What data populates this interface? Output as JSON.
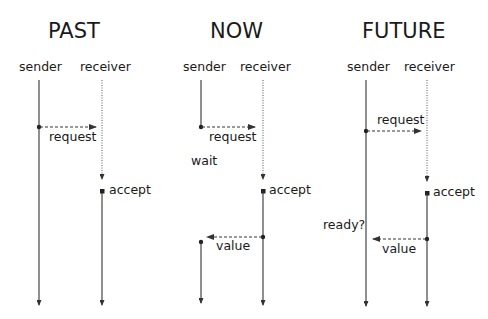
{
  "colors": {
    "line": "#333333",
    "text": "#1a1a1a",
    "background": "#ffffff"
  },
  "panels": [
    {
      "title": "PAST",
      "sender_label": "sender",
      "receiver_label": "receiver",
      "request_label": "request",
      "accept_label": "accept"
    },
    {
      "title": "NOW",
      "sender_label": "sender",
      "receiver_label": "receiver",
      "request_label": "request",
      "wait_label": "wait",
      "accept_label": "accept",
      "value_label": "value"
    },
    {
      "title": "FUTURE",
      "sender_label": "sender",
      "receiver_label": "receiver",
      "request_label": "request",
      "accept_label": "accept",
      "ready_label": "ready?",
      "value_label": "value"
    }
  ]
}
